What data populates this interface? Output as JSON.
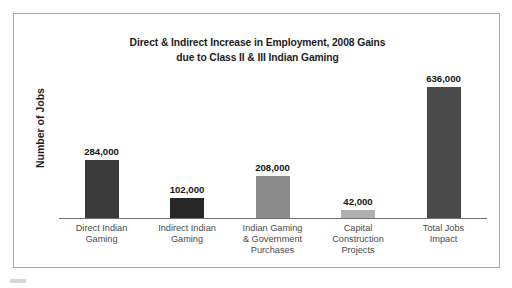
{
  "chart_data": {
    "type": "bar",
    "title": "Direct & Indirect Increase in Employment, 2008 Gains due to Class II & III Indian Gaming",
    "title_line1": "Direct & Indirect Increase in Employment, 2008 Gains",
    "title_line2": "due to Class II & III Indian Gaming",
    "xlabel": "",
    "ylabel": "Number of Jobs",
    "ylim": [
      0,
      700000
    ],
    "grid": false,
    "legend": "none",
    "categories": [
      "Direct Indian Gaming",
      "Indirect Indian Gaming",
      "Indian Gaming & Government Purchases",
      "Capital Construction Projects",
      "Total Jobs Impact"
    ],
    "category_lines": [
      [
        "Direct Indian",
        "Gaming"
      ],
      [
        "Indirect Indian",
        "Gaming"
      ],
      [
        "Indian Gaming",
        "& Government",
        "Purchases"
      ],
      [
        "Capital",
        "Construction",
        "Projects"
      ],
      [
        "Total Jobs",
        "Impact"
      ]
    ],
    "values": [
      284000,
      102000,
      208000,
      42000,
      636000
    ],
    "value_labels": [
      "284,000",
      "102,000",
      "208,000",
      "42,000",
      "636,000"
    ],
    "bar_colors": [
      "#3a3a3a",
      "#282828",
      "#8c8c8c",
      "#b0b0b0",
      "#4a4a4a"
    ]
  },
  "colors": {
    "page_background": "#ffffff",
    "frame_border": "#a9a9a9",
    "axis_line": "#6e6e6e",
    "title_text": "#1d1d1d",
    "category_text": "#4a4a4a",
    "value_text": "#161616"
  }
}
